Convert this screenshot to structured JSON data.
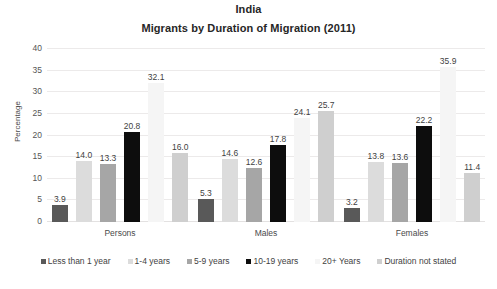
{
  "chart_data": {
    "type": "bar",
    "title": "India",
    "subtitle": "Migrants by Duration of Migration (2011)",
    "xlabel": "",
    "ylabel": "Percentage",
    "ylim": [
      0,
      40
    ],
    "yticks": [
      "0",
      "5",
      "10",
      "15",
      "20",
      "25",
      "30",
      "35",
      "40"
    ],
    "grid": true,
    "legend_position": "bottom",
    "categories": [
      "Persons",
      "Males",
      "Females"
    ],
    "series": [
      {
        "name": "Less than 1 year",
        "color": "#595959",
        "values": [
          3.9,
          5.3,
          3.2
        ],
        "labels": [
          "3.9",
          "5.3",
          "3.2"
        ]
      },
      {
        "name": "1-4 years",
        "color": "#dcdcdc",
        "values": [
          14.0,
          14.6,
          13.8
        ],
        "labels": [
          "14.0",
          "14.6",
          "13.8"
        ]
      },
      {
        "name": "5-9 years",
        "color": "#a6a6a6",
        "values": [
          13.3,
          12.6,
          13.6
        ],
        "labels": [
          "13.3",
          "12.6",
          "13.6"
        ]
      },
      {
        "name": "10-19 years",
        "color": "#0d0d0d",
        "values": [
          20.8,
          17.8,
          22.2
        ],
        "labels": [
          "20.8",
          "17.8",
          "22.2"
        ]
      },
      {
        "name": "20+ Years",
        "color": "#f5f5f5",
        "values": [
          32.1,
          24.1,
          35.9
        ],
        "labels": [
          "32.1",
          "24.1",
          "35.9"
        ]
      },
      {
        "name": "Duration not stated",
        "color": "#cfcfcf",
        "values": [
          16.0,
          25.7,
          11.4
        ],
        "labels": [
          "16.0",
          "25.7",
          "11.4"
        ]
      }
    ]
  }
}
